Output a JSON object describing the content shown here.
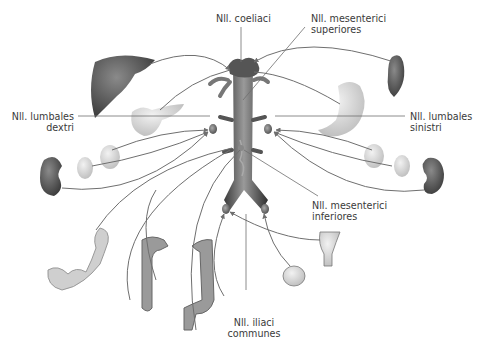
{
  "diagram": {
    "labels": {
      "coeliaci": "Nll. coeliaci",
      "mes_sup_1": "Nll. mesenterici",
      "mes_sup_2": "superiores",
      "lumb_dex_1": "Nll. lumbales",
      "lumb_dex_2": "dextri",
      "lumb_sin_1": "Nll. lumbales",
      "lumb_sin_2": "sinistri",
      "mes_inf_1": "Nll. mesenterici",
      "mes_inf_2": "inferiores",
      "iliaci_1": "Nll. iliaci",
      "iliaci_2": "communes"
    },
    "organs": [
      "liver",
      "spleen",
      "pancreas",
      "stomach",
      "right kidney",
      "right adrenal gland",
      "right gonad/ureter",
      "left kidney",
      "left adrenal gland",
      "left gonad",
      "small intestine",
      "ascending colon",
      "descending colon",
      "sigmoid colon",
      "rectum",
      "uterus",
      "bladder/prostate"
    ],
    "nodes": [
      "coeliac",
      "superior mesenteric",
      "right lumbar",
      "left lumbar",
      "inferior mesenteric",
      "right common iliac",
      "left common iliac"
    ],
    "colors": {
      "line": "#6f6f6f",
      "text": "#3a3a3a",
      "aorta": "#4a4a4a",
      "liver": "#5a5a5a"
    }
  }
}
